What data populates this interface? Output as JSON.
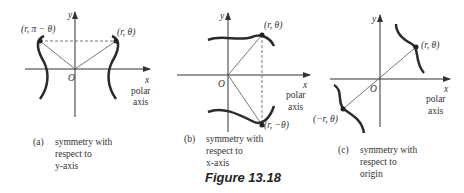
{
  "figure_caption": "Figure 13.18",
  "panels": [
    {
      "id": "a",
      "axis_labels": {
        "y": "y",
        "x": "x",
        "origin": "O",
        "polar": "polar",
        "axis": "axis"
      },
      "points": [
        {
          "label": "(r, π − θ)"
        },
        {
          "label": "(r, θ)"
        }
      ],
      "caption": {
        "tag": "(a)",
        "lines": [
          "symmetry with",
          "respect to",
          "y-axis"
        ]
      }
    },
    {
      "id": "b",
      "axis_labels": {
        "y": "y",
        "x": "x",
        "origin": "O",
        "polar": "polar",
        "axis": "axis"
      },
      "points": [
        {
          "label": "(r, θ)"
        },
        {
          "label": "(r, −θ)"
        }
      ],
      "caption": {
        "tag": "(b)",
        "lines": [
          "symmetry with",
          "respect to",
          "x-axis"
        ]
      }
    },
    {
      "id": "c",
      "axis_labels": {
        "y": "y",
        "x": "x",
        "origin": "O",
        "polar": "polar",
        "axis": "axis"
      },
      "points": [
        {
          "label": "(r, θ)"
        },
        {
          "label": "(−r, θ)"
        }
      ],
      "caption": {
        "tag": "(c)",
        "lines": [
          "symmetry with",
          "respect to",
          "origin"
        ]
      }
    }
  ],
  "colors": {
    "axis": "#333333",
    "curve": "#2b2b2b",
    "line": "#555555"
  }
}
